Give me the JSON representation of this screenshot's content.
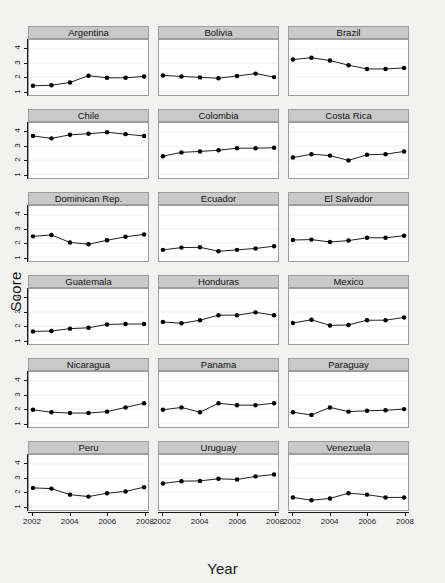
{
  "chart_data": {
    "type": "line",
    "title": "",
    "xlabel": "Year",
    "ylabel": "Score",
    "xlim": [
      2002,
      2008
    ],
    "ylim": [
      1,
      4.3
    ],
    "x": [
      2002,
      2003,
      2004,
      2005,
      2006,
      2007,
      2008
    ],
    "xticks": [
      "2002",
      "2004",
      "2006",
      "2008"
    ],
    "xtick_values": [
      2002,
      2004,
      2006,
      2008
    ],
    "yticks": [
      "1",
      "2",
      "3",
      "4"
    ],
    "ytick_values": [
      1,
      2,
      3,
      4
    ],
    "grid": true,
    "legend": "none",
    "layout": {
      "rows": 6,
      "cols": 3
    },
    "marker": "filled-circle",
    "series": [
      {
        "name": "Argentina",
        "values": [
          1.38,
          1.42,
          1.62,
          2.1,
          1.95,
          1.95,
          2.05
        ]
      },
      {
        "name": "Bolivia",
        "values": [
          2.12,
          2.05,
          1.98,
          1.92,
          2.08,
          2.25,
          2.0
        ]
      },
      {
        "name": "Brazil",
        "values": [
          3.25,
          3.38,
          3.18,
          2.85,
          2.58,
          2.58,
          2.65
        ]
      },
      {
        "name": "Chile",
        "values": [
          3.72,
          3.55,
          3.8,
          3.88,
          3.98,
          3.85,
          3.72
        ]
      },
      {
        "name": "Colombia",
        "values": [
          2.28,
          2.55,
          2.62,
          2.7,
          2.85,
          2.85,
          2.88
        ]
      },
      {
        "name": "Costa Rica",
        "values": [
          2.18,
          2.42,
          2.32,
          1.98,
          2.38,
          2.42,
          2.62
        ]
      },
      {
        "name": "Dominican Rep.",
        "values": [
          2.48,
          2.58,
          2.05,
          1.92,
          2.2,
          2.45,
          2.62
        ]
      },
      {
        "name": "Ecuador",
        "values": [
          1.52,
          1.68,
          1.7,
          1.42,
          1.52,
          1.62,
          1.78
        ]
      },
      {
        "name": "El Salvador",
        "values": [
          2.22,
          2.25,
          2.08,
          2.18,
          2.38,
          2.38,
          2.52
        ]
      },
      {
        "name": "Guatemala",
        "values": [
          1.62,
          1.65,
          1.82,
          1.88,
          2.12,
          2.15,
          2.15
        ]
      },
      {
        "name": "Honduras",
        "values": [
          2.3,
          2.2,
          2.42,
          2.78,
          2.78,
          2.98,
          2.78
        ]
      },
      {
        "name": "Mexico",
        "values": [
          2.22,
          2.45,
          2.05,
          2.08,
          2.42,
          2.42,
          2.62
        ]
      },
      {
        "name": "Nicaragua",
        "values": [
          1.95,
          1.78,
          1.72,
          1.72,
          1.82,
          2.12,
          2.42
        ]
      },
      {
        "name": "Panama",
        "values": [
          1.95,
          2.12,
          1.78,
          2.42,
          2.28,
          2.28,
          2.42
        ]
      },
      {
        "name": "Paraguay",
        "values": [
          1.78,
          1.58,
          2.12,
          1.82,
          1.88,
          1.92,
          2.0
        ]
      },
      {
        "name": "Peru",
        "values": [
          2.3,
          2.25,
          1.82,
          1.68,
          1.92,
          2.05,
          2.35
        ]
      },
      {
        "name": "Uruguay",
        "values": [
          2.62,
          2.78,
          2.8,
          2.95,
          2.9,
          3.12,
          3.25
        ]
      },
      {
        "name": "Venezuela",
        "values": [
          1.62,
          1.42,
          1.55,
          1.92,
          1.82,
          1.62,
          1.62
        ]
      }
    ]
  },
  "axes": {
    "ylabel": "Score",
    "xlabel": "Year"
  },
  "panels": [
    {
      "label": "Argentina"
    },
    {
      "label": "Bolivia"
    },
    {
      "label": "Brazil"
    },
    {
      "label": "Chile"
    },
    {
      "label": "Colombia"
    },
    {
      "label": "Costa Rica"
    },
    {
      "label": "Dominican Rep."
    },
    {
      "label": "Ecuador"
    },
    {
      "label": "El Salvador"
    },
    {
      "label": "Guatemala"
    },
    {
      "label": "Honduras"
    },
    {
      "label": "Mexico"
    },
    {
      "label": "Nicaragua"
    },
    {
      "label": "Panama"
    },
    {
      "label": "Paraguay"
    },
    {
      "label": "Peru"
    },
    {
      "label": "Uruguay"
    },
    {
      "label": "Venezuela"
    }
  ],
  "colors": {
    "background": "#f2f2f0",
    "panel_background": "#ffffff",
    "strip_background": "#c9c9c9",
    "strip_border": "#9d9d9d",
    "line": "#1a1a1a",
    "marker": "#000000",
    "grid": "#f0f0f0",
    "axis_text": "#1a1a1a"
  }
}
